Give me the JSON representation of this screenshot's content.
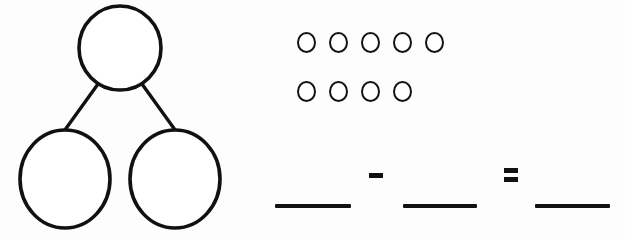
{
  "worksheet": {
    "title": "Number Bond Subtraction Worksheet",
    "background_color": "#fdfdfd",
    "ink_color": "#121212",
    "width": 625,
    "height": 240
  },
  "number_bond": {
    "label": "number bond",
    "whole": {
      "value": "",
      "placeholder": ""
    },
    "parts": [
      {
        "value": "",
        "placeholder": ""
      },
      {
        "value": "",
        "placeholder": ""
      }
    ],
    "circle_count": 3
  },
  "counters": {
    "label": "counters",
    "total": 9,
    "rows": [
      {
        "count": 5,
        "items": [
          "circle",
          "circle",
          "circle",
          "circle",
          "circle"
        ]
      },
      {
        "count": 4,
        "items": [
          "circle",
          "circle",
          "circle",
          "circle"
        ]
      }
    ]
  },
  "equation": {
    "label": "subtraction equation",
    "expression": "___ - ___ = ___",
    "terms": [
      {
        "name": "minuend",
        "value": "",
        "kind": "blank"
      },
      {
        "name": "subtrahend",
        "value": "",
        "kind": "blank"
      },
      {
        "name": "difference",
        "value": "",
        "kind": "blank"
      }
    ],
    "operators": [
      {
        "name": "minus",
        "symbol": "-"
      },
      {
        "name": "equals",
        "symbol": "="
      }
    ]
  }
}
